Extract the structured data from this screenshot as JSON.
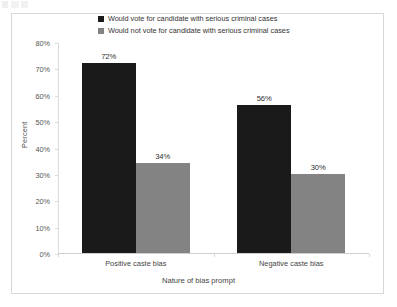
{
  "chart_data": {
    "type": "bar",
    "title": "",
    "xlabel": "Nature of bias prompt",
    "ylabel": "Percent",
    "categories": [
      "Positive caste bias",
      "Negative caste bias"
    ],
    "series": [
      {
        "name": "Would vote for candidate with serious criminal cases",
        "color": "#1a1a1a",
        "values": [
          72,
          56
        ],
        "labels": [
          "72%",
          "34%"
        ]
      },
      {
        "name": "Would not vote for candidate with serious criminal cases",
        "color": "#838383",
        "values": [
          34,
          30
        ],
        "labels": [
          "56%",
          "30%"
        ]
      }
    ],
    "bar_labels": [
      {
        "text": "72%",
        "series": 0,
        "category": 0
      },
      {
        "text": "34%",
        "series": 1,
        "category": 0
      },
      {
        "text": "56%",
        "series": 0,
        "category": 1
      },
      {
        "text": "30%",
        "series": 1,
        "category": 1
      }
    ],
    "ylim": [
      0,
      80
    ],
    "y_ticks": [
      "0%",
      "10%",
      "20%",
      "30%",
      "40%",
      "50%",
      "60%",
      "70%",
      "80%"
    ],
    "y_tick_values": [
      0,
      10,
      20,
      30,
      40,
      50,
      60,
      70,
      80
    ],
    "grid": false,
    "legend_position": "top"
  },
  "legend": {
    "items": [
      {
        "label": "Would vote for candidate with serious criminal cases",
        "color": "#1a1a1a"
      },
      {
        "label": "Would not vote for candidate with serious criminal cases",
        "color": "#838383"
      }
    ]
  },
  "axes": {
    "y_title": "Percent",
    "x_title": "Nature of bias prompt"
  }
}
